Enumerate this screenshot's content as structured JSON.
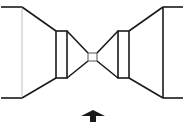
{
  "diagram": {
    "colors": {
      "line": "#1a1a1a",
      "faint_line": "#bdbdbd",
      "background": "#ffffff"
    },
    "left_assembly": {
      "top_lead": [
        [
          1,
          7
        ],
        [
          22,
          7
        ]
      ],
      "bottom_lead": [
        [
          1,
          98
        ],
        [
          22,
          98
        ]
      ],
      "aperture_line": [
        [
          22,
          7
        ],
        [
          22,
          98
        ]
      ],
      "cone_top": [
        [
          22,
          7
        ],
        [
          56,
          31
        ]
      ],
      "cone_bottom": [
        [
          22,
          98
        ],
        [
          56,
          78
        ]
      ],
      "lens_box": {
        "x": 56,
        "y": 31,
        "w": 11,
        "h": 47
      },
      "taper_top": [
        [
          67,
          31
        ],
        [
          88,
          53
        ]
      ],
      "taper_bottom": [
        [
          67,
          78
        ],
        [
          88,
          61
        ]
      ]
    },
    "focal_square": {
      "x": 88,
      "y": 53,
      "w": 9,
      "h": 8
    },
    "right_assembly": {
      "taper_top": [
        [
          97,
          53
        ],
        [
          118,
          31
        ]
      ],
      "taper_bottom": [
        [
          97,
          61
        ],
        [
          118,
          78
        ]
      ],
      "lens_box": {
        "x": 118,
        "y": 31,
        "w": 11,
        "h": 47
      },
      "cone_top": [
        [
          129,
          31
        ],
        [
          163,
          7
        ]
      ],
      "cone_bottom": [
        [
          129,
          78
        ],
        [
          163,
          98
        ]
      ],
      "aperture_line": [
        [
          163,
          7
        ],
        [
          163,
          98
        ]
      ],
      "top_lead": [
        [
          163,
          7
        ],
        [
          183,
          7
        ]
      ],
      "bottom_lead": [
        [
          163,
          98
        ],
        [
          183,
          98
        ]
      ]
    },
    "arrow": {
      "direction": "up",
      "icon": "arrow-up-icon",
      "points": "93,110 105,116 96,116 96,122 90,122 90,116 81,116"
    }
  }
}
